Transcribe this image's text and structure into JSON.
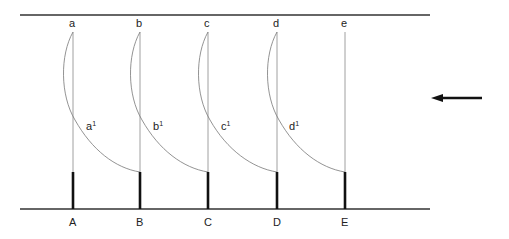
{
  "diagram": {
    "type": "schematic",
    "colors": {
      "line": "#333333",
      "thin": "#888888",
      "background": "#ffffff"
    },
    "top_labels": [
      "a",
      "b",
      "c",
      "d",
      "e"
    ],
    "bottom_labels": [
      "A",
      "B",
      "C",
      "D",
      "E"
    ],
    "curve_labels": [
      {
        "base": "a",
        "sup": "1"
      },
      {
        "base": "b",
        "sup": "1"
      },
      {
        "base": "c",
        "sup": "1"
      },
      {
        "base": "d",
        "sup": "1"
      }
    ],
    "arrow": {
      "direction": "left"
    }
  }
}
